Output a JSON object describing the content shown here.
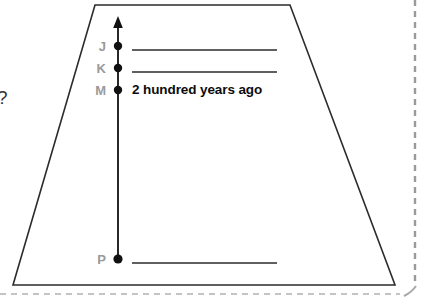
{
  "diagram": {
    "type": "timeline-axis-diagram",
    "shape": {
      "name": "trapezoid-frame",
      "stroke_color": "#2b2b2b",
      "fill_color": "#ffffff",
      "points": "95,5 290,5 395,285 13,285"
    },
    "axis": {
      "name": "vertical-time-axis",
      "orientation": "vertical",
      "direction": "up",
      "arrowhead": "up",
      "color": "#111111",
      "x": 118,
      "top_y": 18,
      "bottom_y": 262
    },
    "ticks": [
      {
        "label": "J",
        "y": 46,
        "has_line": true,
        "line_text": ""
      },
      {
        "label": "K",
        "y": 68,
        "has_line": true,
        "line_text": ""
      },
      {
        "label": "M",
        "y": 90,
        "has_line": false,
        "line_text": "2 hundred years ago"
      },
      {
        "label": "P",
        "y": 259,
        "has_line": true,
        "line_text": ""
      }
    ],
    "annotation": {
      "text": "2 hundred years ago",
      "color": "#0c0c0c"
    },
    "blank_lines": [
      {
        "name": "blank-line-j",
        "x1": 132,
        "x2": 277,
        "y": 50
      },
      {
        "name": "blank-line-k",
        "x1": 132,
        "x2": 277,
        "y": 72
      },
      {
        "name": "blank-line-p",
        "x1": 132,
        "x2": 277,
        "y": 263
      }
    ],
    "left_question_mark": "?",
    "edge_markers": {
      "right_dashed_line_color": "#9a9a9a",
      "bottom_dashed_line_color": "#bdbdbd",
      "corner_curve_color": "#b0b0b0"
    }
  }
}
